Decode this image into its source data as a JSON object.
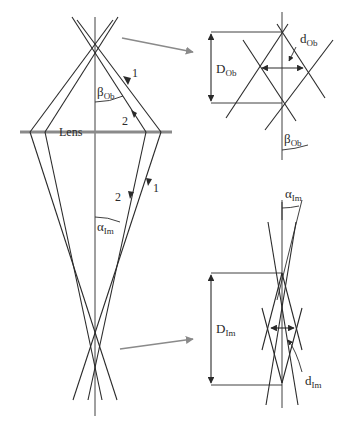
{
  "figure": {
    "type": "ray optics diagram",
    "main": {
      "lens_label": "Lens",
      "ray1_label_upper": "1",
      "ray2_label_upper": "2",
      "ray1_label_lower": "1",
      "ray2_label_lower": "2",
      "angle_object": {
        "symbol": "β",
        "sub": "Ob"
      },
      "angle_image": {
        "symbol": "α",
        "sub": "Im"
      }
    },
    "object_detail": {
      "length_label": {
        "symbol": "D",
        "sub": "Ob"
      },
      "width_label": {
        "symbol": "d",
        "sub": "Ob"
      },
      "angle_label": {
        "symbol": "β",
        "sub": "Ob"
      }
    },
    "image_detail": {
      "length_label": {
        "symbol": "D",
        "sub": "Im"
      },
      "width_label": {
        "symbol": "d",
        "sub": "Im"
      },
      "angle_label": {
        "symbol": "α",
        "sub": "Im"
      }
    },
    "colors": {
      "line": "#2a2a2a",
      "lens": "#8a8a8a",
      "pointer_arrow": "#8a8a8a"
    }
  }
}
